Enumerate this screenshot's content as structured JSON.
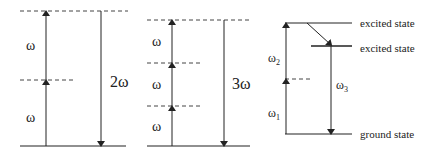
{
  "panels": [
    {
      "id": "two-photon",
      "labels": {
        "lower_step": "ω",
        "upper_step": "ω",
        "emission": "2ω"
      }
    },
    {
      "id": "three-photon",
      "labels": {
        "step1": "ω",
        "step2": "ω",
        "step3": "ω",
        "emission": "3ω"
      }
    },
    {
      "id": "two-color",
      "labels": {
        "pump1": "ω",
        "pump1_sub": "1",
        "pump2": "ω",
        "pump2_sub": "2",
        "emission": "ω",
        "emission_sub": "3",
        "upper_state": "excited state",
        "lower_excited_state": "excited state",
        "ground_state": "ground state"
      }
    }
  ],
  "colors": {
    "line": "#222222",
    "dashed": "#444444"
  }
}
